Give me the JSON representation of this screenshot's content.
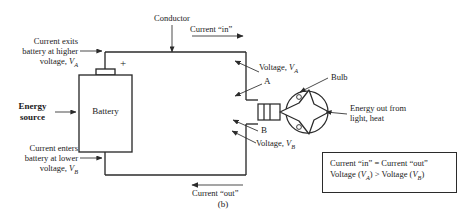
{
  "figure": {
    "caption": "(b)",
    "type": "circuit-diagram",
    "background_color": "#ffffff",
    "line_color": "#2b2b2b"
  },
  "components": {
    "battery": {
      "label": "Battery",
      "terminal_sign": "+"
    },
    "bulb": {
      "label": "Bulb"
    }
  },
  "labels": {
    "conductor": "Conductor",
    "current_in": "Current “in”",
    "current_out": "Current “out”",
    "energy_source_line1": "Energy",
    "energy_source_line2": "source",
    "current_exits_line1": "Current exits",
    "current_exits_line2": "battery at higher",
    "current_exits_line3_pre": "voltage, ",
    "current_exits_line3_var": "V",
    "current_exits_line3_sub": "A",
    "current_enters_line1": "Current enters",
    "current_enters_line2": "battery at lower",
    "current_enters_line3_pre": "voltage, ",
    "current_enters_line3_var": "V",
    "current_enters_line3_sub": "B",
    "voltage_a_pre": "Voltage, ",
    "voltage_a_var": "V",
    "voltage_a_sub": "A",
    "voltage_b_pre": "Voltage, ",
    "voltage_b_var": "V",
    "voltage_b_sub": "B",
    "point_a": "A",
    "point_b": "B",
    "energy_out_line1": "Energy out from",
    "energy_out_line2": "light, heat"
  },
  "legend": {
    "line1": {
      "left": "Current “in”",
      "operator": "=",
      "right": "Current “out”"
    },
    "line2": {
      "left_pre": "Voltage (",
      "left_var": "V",
      "left_sub": "A",
      "left_post": ")",
      "operator": ">",
      "right_pre": "Voltage (",
      "right_var": "V",
      "right_sub": "B",
      "right_post": ")"
    }
  }
}
